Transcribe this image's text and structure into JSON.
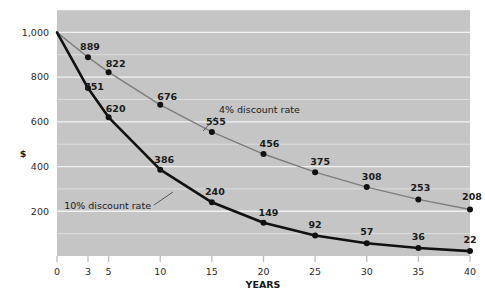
{
  "chart_data": {
    "type": "line",
    "title": "",
    "subtitle": "",
    "xlabel": "YEARS",
    "ylabel": "$",
    "x": [
      0,
      3,
      5,
      10,
      15,
      20,
      25,
      30,
      35,
      40
    ],
    "xticks": [
      "0",
      "3",
      "5",
      "10",
      "15",
      "20",
      "25",
      "30",
      "35",
      "40"
    ],
    "yticks": [
      "200",
      "400",
      "600",
      "800",
      "1,000"
    ],
    "ytickvalues": [
      200,
      400,
      600,
      800,
      1000
    ],
    "xlim": [
      0,
      40
    ],
    "ylim": [
      0,
      1100
    ],
    "grid": true,
    "legend_position": "inline-annotation",
    "plot_background": "#c5c5c5",
    "gridline_color": "#f2f2f2",
    "series": [
      {
        "name": "4% discount rate",
        "color": "#7d7d7d",
        "marker_color": "#111111",
        "line_width": 1.4,
        "values": [
          1000,
          889,
          822,
          676,
          555,
          456,
          375,
          308,
          253,
          208
        ],
        "labels": [
          "",
          "889",
          "822",
          "676",
          "555",
          "456",
          "375",
          "308",
          "253",
          "208"
        ]
      },
      {
        "name": "10% discount rate",
        "color": "#111111",
        "marker_color": "#111111",
        "line_width": 2.6,
        "values": [
          1000,
          751,
          620,
          386,
          240,
          149,
          92,
          57,
          36,
          22
        ],
        "labels": [
          "",
          "751",
          "620",
          "386",
          "240",
          "149",
          "92",
          "57",
          "36",
          "22"
        ]
      }
    ],
    "annotations": [
      {
        "text": "4% discount rate",
        "color": "#1a1a1a"
      },
      {
        "text": "10% discount rate",
        "color": "#1a1a1a"
      }
    ]
  }
}
